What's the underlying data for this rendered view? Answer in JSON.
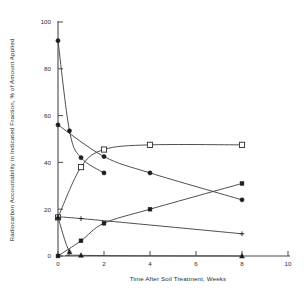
{
  "chart_data": {
    "type": "line",
    "title": "",
    "xlabel": "Time After Soil Treatment, Weeks",
    "ylabel": "Radiocarbon Accountability in Indicated Fraction, % of Amount Applied",
    "xlim": [
      0,
      10
    ],
    "ylim": [
      0,
      100
    ],
    "xticks": [
      0,
      2,
      4,
      6,
      8,
      10
    ],
    "yticks": [
      0,
      20,
      40,
      60,
      80,
      100
    ],
    "xtick_labels": [
      "0",
      "2",
      "4",
      "6",
      "8",
      "10"
    ],
    "ytick_labels": [
      "0",
      "20",
      "40",
      "60",
      "80",
      "100"
    ],
    "grid": false,
    "legend": "none",
    "series": [
      {
        "name": "parent-compound-decline",
        "marker": "filled-circle",
        "x": [
          0,
          0.5,
          1,
          2
        ],
        "y": [
          92,
          53.5,
          42,
          35.5
        ]
      },
      {
        "name": "soil-bound-residue",
        "marker": "open-square",
        "x": [
          0,
          1,
          2,
          4,
          8
        ],
        "y": [
          16.5,
          38,
          45.5,
          47.5,
          47.5
        ]
      },
      {
        "name": "extractable-metabolites",
        "marker": "filled-circle",
        "x": [
          0,
          2,
          4,
          8
        ],
        "y": [
          56,
          42.5,
          35.5,
          24
        ]
      },
      {
        "name": "mineralized-fraction",
        "marker": "filled-square",
        "x": [
          0,
          1,
          2,
          4,
          8
        ],
        "y": [
          0,
          6.5,
          14,
          20,
          31
        ]
      },
      {
        "name": "water-soluble-fraction",
        "marker": "cross",
        "x": [
          0,
          1,
          8
        ],
        "y": [
          16.5,
          16,
          9.5
        ]
      },
      {
        "name": "volatile-fraction",
        "marker": "filled-triangle",
        "x": [
          0,
          0.5,
          1,
          8
        ],
        "y": [
          16.5,
          1.8,
          0.3,
          0
        ]
      }
    ]
  },
  "axes": {
    "x_axis_label": "Time After Soil Treatment, Weeks",
    "y_axis_label": "Radiocarbon Accountability in Indicated Fraction, % of Amount Applied"
  }
}
